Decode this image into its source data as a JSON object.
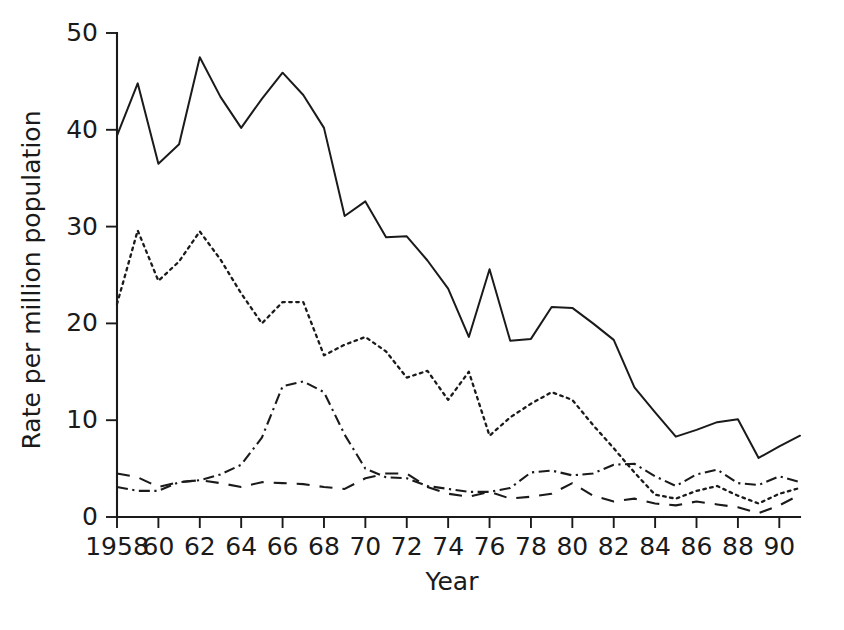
{
  "chart_data": {
    "type": "line",
    "title": "",
    "xlabel": "Year",
    "ylabel": "Rate per million population",
    "xlim": [
      1958,
      1991
    ],
    "ylim": [
      0,
      50
    ],
    "grid": false,
    "legend_position": "none",
    "x_tick_labels": [
      "1958",
      "60",
      "62",
      "64",
      "66",
      "68",
      "70",
      "72",
      "74",
      "76",
      "78",
      "80",
      "82",
      "84",
      "86",
      "88",
      "90"
    ],
    "x_tick_values": [
      1958,
      1960,
      1962,
      1964,
      1966,
      1968,
      1970,
      1972,
      1974,
      1976,
      1978,
      1980,
      1982,
      1984,
      1986,
      1988,
      1990
    ],
    "y_tick_labels": [
      "0",
      "10",
      "20",
      "30",
      "40",
      "50"
    ],
    "y_tick_values": [
      0,
      10,
      20,
      30,
      40,
      50
    ],
    "x": [
      1958,
      1959,
      1960,
      1961,
      1962,
      1963,
      1964,
      1965,
      1966,
      1967,
      1968,
      1969,
      1970,
      1971,
      1972,
      1973,
      1974,
      1975,
      1976,
      1977,
      1978,
      1979,
      1980,
      1981,
      1982,
      1983,
      1984,
      1985,
      1986,
      1987,
      1988,
      1989,
      1990,
      1991
    ],
    "series": [
      {
        "name": "total",
        "linestyle": "solid",
        "color": "#1a1a1a",
        "values": [
          39.4,
          44.8,
          36.5,
          38.5,
          47.5,
          43.4,
          40.2,
          43.2,
          45.9,
          43.6,
          40.2,
          31.1,
          32.6,
          28.9,
          29.0,
          26.5,
          23.6,
          18.6,
          25.6,
          18.2,
          18.4,
          21.7,
          21.6,
          20.0,
          18.3,
          13.4,
          10.8,
          8.3,
          9.0,
          9.8,
          10.1,
          6.1,
          7.3,
          8.4
        ]
      },
      {
        "name": "series-dotted",
        "linestyle": "dotted",
        "color": "#1a1a1a",
        "values": [
          22.0,
          29.6,
          24.4,
          26.4,
          29.5,
          26.6,
          23.1,
          20.0,
          22.2,
          22.2,
          16.7,
          17.8,
          18.6,
          17.1,
          14.4,
          15.1,
          12.1,
          15.0,
          8.4,
          10.3,
          11.7,
          12.9,
          12.1,
          9.5,
          7.1,
          4.6,
          2.3,
          1.9,
          2.7,
          3.2,
          2.2,
          1.4,
          2.4,
          3.0
        ]
      },
      {
        "name": "series-dashdot",
        "linestyle": "dashdot",
        "color": "#1a1a1a",
        "values": [
          3.1,
          2.7,
          2.7,
          3.6,
          3.8,
          4.4,
          5.4,
          8.2,
          13.5,
          14.0,
          12.9,
          8.5,
          5.0,
          4.1,
          4.0,
          3.2,
          2.9,
          2.6,
          2.6,
          3.0,
          4.6,
          4.8,
          4.3,
          4.5,
          5.4,
          5.5,
          4.2,
          3.2,
          4.4,
          4.9,
          3.5,
          3.3,
          4.2,
          3.6
        ]
      },
      {
        "name": "series-dashed",
        "linestyle": "dashed",
        "color": "#1a1a1a",
        "values": [
          4.5,
          4.1,
          3.1,
          3.6,
          3.8,
          3.5,
          3.1,
          3.6,
          3.5,
          3.4,
          3.1,
          2.9,
          4.0,
          4.5,
          4.5,
          3.1,
          2.4,
          2.1,
          2.6,
          1.9,
          2.1,
          2.4,
          3.5,
          2.2,
          1.6,
          1.9,
          1.4,
          1.2,
          1.6,
          1.3,
          1.0,
          0.4,
          1.2,
          2.3
        ]
      }
    ]
  }
}
